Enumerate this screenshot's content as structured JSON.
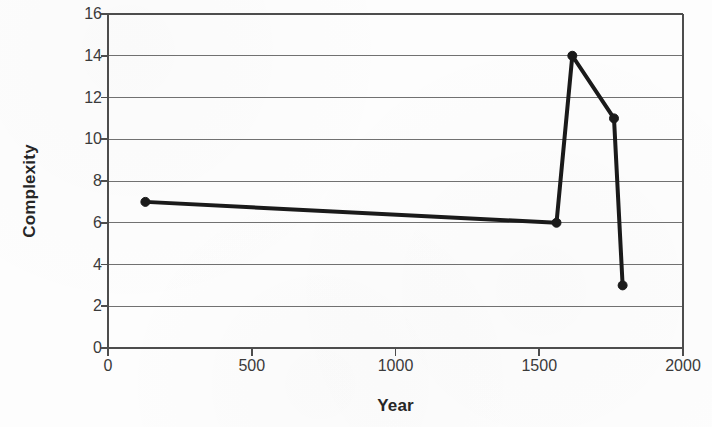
{
  "chart_data": {
    "type": "line",
    "title": "",
    "subtitle": "",
    "xlabel": "Year",
    "ylabel": "Complexity",
    "xlim": [
      0,
      2000
    ],
    "ylim": [
      0,
      16
    ],
    "xticks": [
      0,
      500,
      1000,
      1500,
      2000
    ],
    "yticks": [
      0,
      2,
      4,
      6,
      8,
      10,
      12,
      14,
      16
    ],
    "xtick_labels": [
      "0",
      "500",
      "1000",
      "1500",
      "2000"
    ],
    "ytick_labels": [
      "0",
      "2",
      "4",
      "6",
      "8",
      "10",
      "12",
      "14",
      "16"
    ],
    "grid": {
      "horizontal": true,
      "vertical": false,
      "color": "#595959"
    },
    "legend": {
      "visible": false,
      "position": "none",
      "entries": []
    },
    "series": [
      {
        "name": "Complexity",
        "color": "#1a1a1a",
        "line_width": 4,
        "marker": "circle-filled",
        "marker_size": 9,
        "x": [
          130,
          1560,
          1615,
          1760,
          1790
        ],
        "y": [
          7,
          6,
          14,
          11,
          3
        ],
        "points": [
          {
            "x": 130,
            "y": 7
          },
          {
            "x": 1560,
            "y": 6
          },
          {
            "x": 1615,
            "y": 14
          },
          {
            "x": 1760,
            "y": 11
          },
          {
            "x": 1790,
            "y": 3
          }
        ]
      }
    ],
    "annotations": [],
    "axis": {
      "left_spine": true,
      "right_spine": true,
      "top_spine": true,
      "bottom_spine": true,
      "spine_color": "#4d4d4d"
    },
    "plot_area_px": {
      "left": 108,
      "top": 14,
      "right": 683,
      "bottom": 348
    }
  }
}
